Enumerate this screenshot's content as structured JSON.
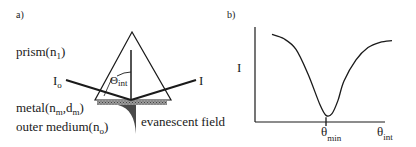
{
  "panel_a": {
    "label": "a)",
    "prism": {
      "text": "prism(n",
      "sub": "1",
      "close": ")"
    },
    "incident": {
      "text": "I",
      "sub": "o"
    },
    "reflected": {
      "text": "I"
    },
    "angle": {
      "symbol": "Θ",
      "sub": "int"
    },
    "metal": {
      "text": "metal(n",
      "sub1": "m",
      "mid": ",d",
      "sub2": "m",
      "close": ")"
    },
    "outer": {
      "text": "outer medium(n",
      "sub": "o",
      "close": ")"
    },
    "evanescent": {
      "text": "evanescent field"
    }
  },
  "panel_b": {
    "label": "b)",
    "ylabel": "I",
    "xmin_label": {
      "symbol": "θ",
      "sub": "min"
    },
    "xlabel": {
      "symbol": "θ",
      "sub": "int"
    }
  },
  "chart_data": {
    "type": "line",
    "title": "",
    "xlabel": "θint",
    "ylabel": "I",
    "x_ticks": [
      "θmin"
    ],
    "series": [
      {
        "name": "reflectivity",
        "x": [
          0.0,
          0.1,
          0.2,
          0.3,
          0.4,
          0.45,
          0.5,
          0.55,
          0.6,
          0.7,
          0.8,
          0.9,
          1.0
        ],
        "y": [
          0.95,
          0.9,
          0.78,
          0.5,
          0.15,
          0.03,
          0.05,
          0.2,
          0.42,
          0.66,
          0.8,
          0.86,
          0.88
        ]
      }
    ],
    "xlim": [
      0,
      1
    ],
    "ylim": [
      0,
      1
    ],
    "grid": false,
    "legend": "none"
  }
}
